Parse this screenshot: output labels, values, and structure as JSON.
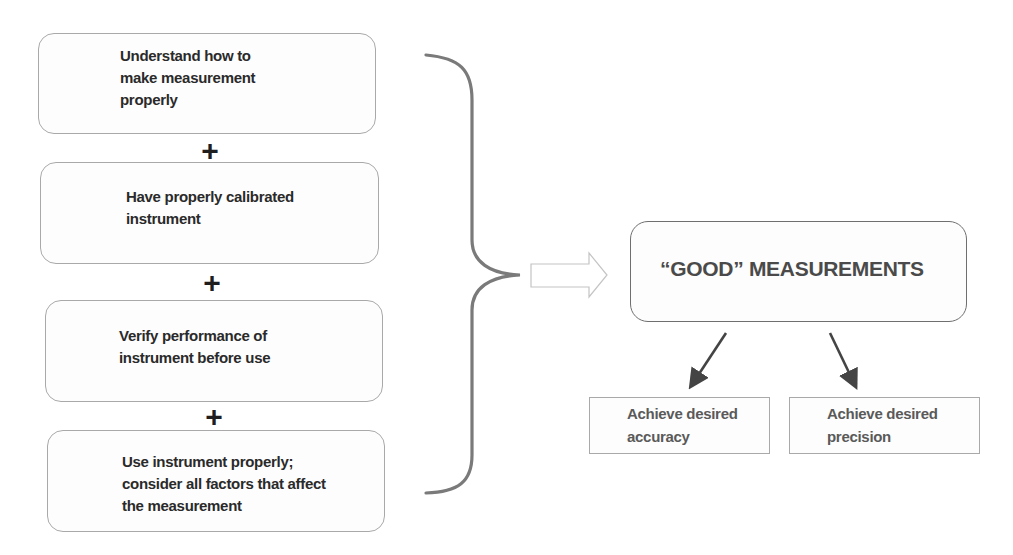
{
  "left_column": {
    "steps": [
      {
        "lines": [
          "Understand how to",
          "make measurement",
          "properly"
        ]
      },
      {
        "lines": [
          "Have properly calibrated",
          "instrument"
        ]
      },
      {
        "lines": [
          "Verify performance of",
          "instrument before use"
        ]
      },
      {
        "lines": [
          "Use instrument properly;",
          "consider all factors that affect",
          "the measurement"
        ]
      }
    ],
    "plus_symbol": "+"
  },
  "connector": {
    "brace": "right-curly-brace",
    "arrow": "hollow-right-arrow"
  },
  "result": {
    "title": "“GOOD” MEASUREMENTS",
    "outcomes": [
      {
        "lines": [
          "Achieve desired",
          "accuracy"
        ]
      },
      {
        "lines": [
          "Achieve desired",
          "precision"
        ]
      }
    ]
  },
  "colors": {
    "box_border": "#a9a9a9",
    "brace": "#7a7a7a",
    "arrow": "#444444",
    "text": "#2a2a2a",
    "title_text": "#4a4a4a"
  }
}
